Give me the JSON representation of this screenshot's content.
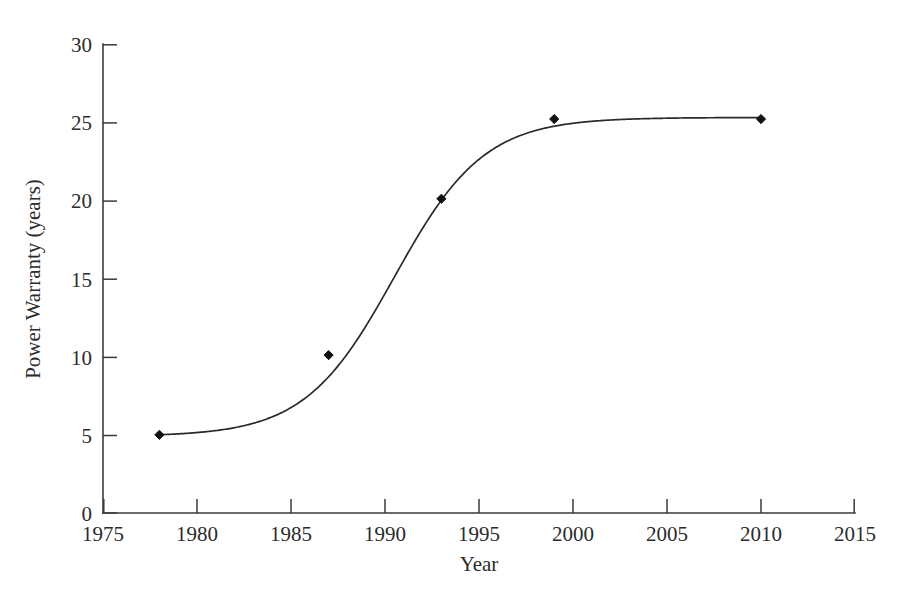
{
  "chart_data": {
    "type": "line",
    "title": "",
    "subtitle": "",
    "xlabel": "Year",
    "ylabel": "Power Warranty (years)",
    "xlim": [
      1975,
      2015
    ],
    "ylim": [
      0,
      30
    ],
    "xticks": [
      1975,
      1980,
      1985,
      1990,
      1995,
      2000,
      2005,
      2010,
      2015
    ],
    "xtick_labels": [
      "1975",
      "1980",
      "1985",
      "1990",
      "1995",
      "2000",
      "2005",
      "2010",
      "2015"
    ],
    "yticks": [
      0,
      5,
      10,
      15,
      20,
      25,
      30
    ],
    "ytick_labels": [
      "0",
      "5",
      "10",
      "15",
      "20",
      "25",
      "30"
    ],
    "grid": false,
    "legend": false,
    "legend_position": "none",
    "marker": "diamond",
    "marker_color": "#111111",
    "line_color": "#2a2a2a",
    "background_color": "#ffffff",
    "axis_color": "#3a3a3a",
    "x": [
      1978,
      1987,
      1993,
      1999,
      2010
    ],
    "values": [
      5.0,
      10.1,
      20.1,
      25.2,
      25.2
    ],
    "points": [
      {
        "x": 1978,
        "y": 5.0
      },
      {
        "x": 1987,
        "y": 10.1
      },
      {
        "x": 1993,
        "y": 20.1
      },
      {
        "x": 1999,
        "y": 25.2
      },
      {
        "x": 2010,
        "y": 25.2
      }
    ],
    "series": [
      {
        "name": "Power Warranty",
        "x": [
          1978,
          1987,
          1993,
          1999,
          2010
        ],
        "values": [
          5.0,
          10.1,
          20.1,
          25.2,
          25.2
        ]
      }
    ],
    "fit": {
      "type": "sigmoid",
      "description": "logistic growth curve through the data points",
      "asymptote": 25.3,
      "midpoint_year": 1990.5,
      "lower_plateau": 4.9
    },
    "annotations": []
  }
}
